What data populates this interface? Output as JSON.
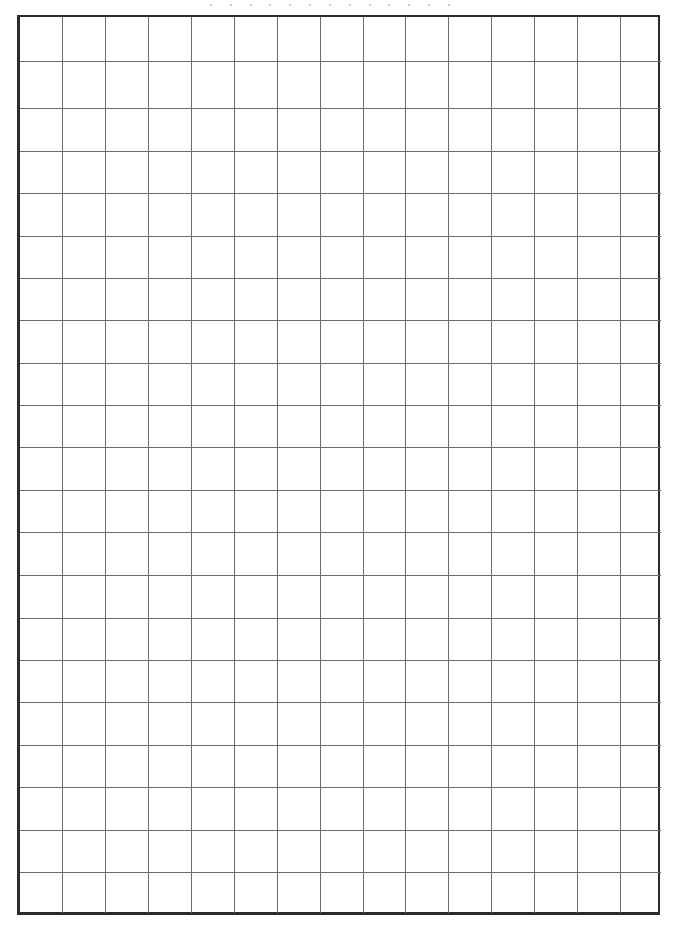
{
  "page": {
    "type": "blank grid paper",
    "grid": {
      "columns": 15,
      "rows": 21,
      "line_color": "#6a6a6a",
      "border_color": "#2b2b2b",
      "background": "#ffffff"
    },
    "cells": []
  }
}
